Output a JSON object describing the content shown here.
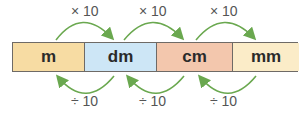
{
  "units": [
    {
      "label": "m",
      "color": "#f7dca3",
      "width": 72
    },
    {
      "label": "dm",
      "color": "#cde6f6",
      "width": 72
    },
    {
      "label": "cm",
      "color": "#f3c7ad",
      "width": 76
    },
    {
      "label": "mm",
      "color": "#fbecc8",
      "width": 66
    }
  ],
  "multiply_labels": [
    "× 10",
    "× 10",
    "× 10"
  ],
  "divide_labels": [
    "÷ 10",
    "÷ 10",
    "÷ 10"
  ],
  "arrow_color": "#6aa84f"
}
